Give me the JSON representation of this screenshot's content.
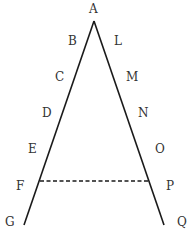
{
  "diagram": {
    "colors": {
      "line": "#1a1a1a",
      "label": "#333333",
      "background": "#ffffff"
    },
    "apex": {
      "name": "A",
      "x": 94,
      "y": 21
    },
    "left_side": {
      "from": [
        94,
        21
      ],
      "to": [
        24,
        225
      ]
    },
    "right_side": {
      "from": [
        94,
        21
      ],
      "to": [
        164,
        225
      ]
    },
    "dashed_segment": {
      "from_point": "F",
      "to_point": "P",
      "from": [
        40,
        181
      ],
      "to": [
        149,
        181
      ]
    },
    "labels": {
      "A": "A",
      "B": "B",
      "C": "C",
      "D": "D",
      "E": "E",
      "F": "F",
      "G": "G",
      "L": "L",
      "M": "M",
      "N": "N",
      "O": "O",
      "P": "P",
      "Q": "Q"
    },
    "left_points": [
      "B",
      "C",
      "D",
      "E",
      "F",
      "G"
    ],
    "right_points": [
      "L",
      "M",
      "N",
      "O",
      "P",
      "Q"
    ]
  }
}
